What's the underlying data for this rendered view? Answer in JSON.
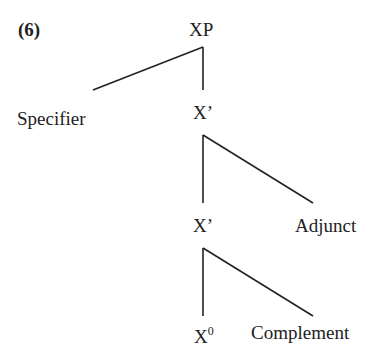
{
  "example_number": "(6)",
  "tree": {
    "root": "XP",
    "specifier": "Specifier",
    "bar_upper": "X’",
    "bar_lower": "X’",
    "adjunct": "Adjunct",
    "head": "X",
    "head_superscript": "0",
    "complement": "Complement"
  }
}
